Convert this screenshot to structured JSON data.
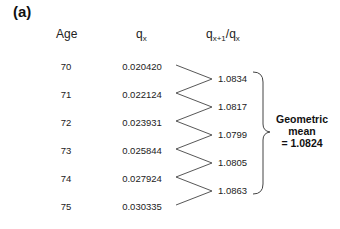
{
  "panel_label": "(a)",
  "headers": {
    "age": "Age",
    "qx_base": "q",
    "qx_sub": "x",
    "ratio_base1": "q",
    "ratio_sub1": "x+1",
    "ratio_slash": "/q",
    "ratio_sub2": "x"
  },
  "rows": [
    {
      "age": "70",
      "qx": "0.020420"
    },
    {
      "age": "71",
      "qx": "0.022124"
    },
    {
      "age": "72",
      "qx": "0.023931"
    },
    {
      "age": "73",
      "qx": "0.025844"
    },
    {
      "age": "74",
      "qx": "0.027924"
    },
    {
      "age": "75",
      "qx": "0.030335"
    }
  ],
  "ratios": [
    "1.0834",
    "1.0817",
    "1.0799",
    "1.0805",
    "1.0863"
  ],
  "summary": {
    "line1": "Geometric",
    "line2": "mean",
    "line3": "= 1.0824"
  },
  "colors": {
    "line": "#444444",
    "text": "#222222"
  }
}
